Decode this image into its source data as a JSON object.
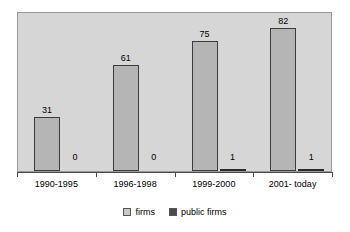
{
  "chart_data": {
    "type": "bar",
    "title": "",
    "subtitle": "",
    "xlabel": "",
    "ylabel": "",
    "grid": false,
    "legend_position": "bottom",
    "ylim": [
      0,
      92
    ],
    "categories": [
      "1990-1995",
      "1996-1998",
      "1999-2000",
      "2001- today"
    ],
    "series": [
      {
        "name": "firms",
        "color": "#b5b5b5",
        "values": [
          31,
          61,
          75,
          82
        ],
        "value_labels": [
          "31",
          "61",
          "75",
          "82"
        ]
      },
      {
        "name": "public firms",
        "color": "#4a4a4a",
        "values": [
          0,
          0,
          1,
          1
        ],
        "value_labels": [
          "0",
          "0",
          "1",
          "1"
        ]
      }
    ]
  },
  "legend": {
    "items": [
      {
        "label": "firms",
        "swatch": "light-gray-swatch"
      },
      {
        "label": "public firms",
        "swatch": "dark-gray-swatch"
      }
    ]
  },
  "colors": {
    "plot_background": "#d6d6d6",
    "plot_border": "#9a9a9a",
    "axis": "#4a4a4a",
    "firms_bar": "#b5b5b5",
    "firms_bar_border": "#3c3c3c",
    "public_bar": "#4a4a4a",
    "text": "#000000"
  }
}
